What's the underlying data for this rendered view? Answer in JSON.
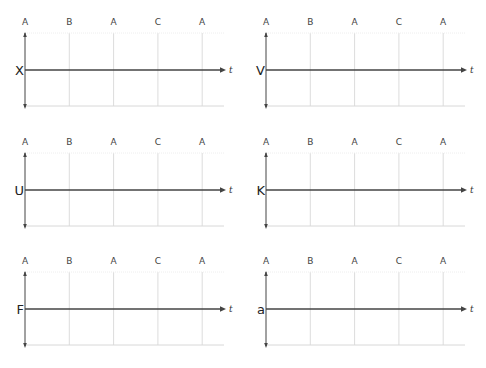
{
  "diagram": {
    "time_axis_label": "t",
    "phase_labels": [
      "A",
      "B",
      "A",
      "C",
      "A"
    ],
    "colors": {
      "axis": "#444444",
      "gridline": "#dcdcdc",
      "text": "#333333"
    },
    "panels": [
      {
        "variable": "X",
        "left": 0,
        "top": 0
      },
      {
        "variable": "V",
        "left": 241,
        "top": 0
      },
      {
        "variable": "U",
        "left": 0,
        "top": 120
      },
      {
        "variable": "K",
        "left": 241,
        "top": 120
      },
      {
        "variable": "F",
        "left": 0,
        "top": 239
      },
      {
        "variable": "a",
        "left": 241,
        "top": 239
      }
    ]
  }
}
